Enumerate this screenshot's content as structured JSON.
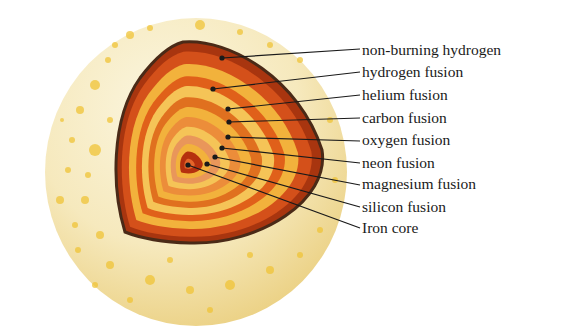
{
  "diagram": {
    "colors": {
      "sphere_light": "#faf3d6",
      "sphere_dark": "#edd48a",
      "speckle": "#f0c437",
      "outline": "#4a2a17",
      "layer_dark_red": "#a8350f",
      "layer_orange": "#e0601a",
      "layer_light_orange": "#ec8d3a",
      "layer_yellow": "#f2b23c",
      "layer_pale": "#f5c457",
      "layer_salmon": "#e9965a",
      "core": "#b5300e",
      "core_inner": "#e4652a"
    },
    "labels": [
      {
        "text": "non-burning hydrogen",
        "y": 41,
        "dot": [
          222,
          58
        ],
        "end": [
          360,
          49
        ]
      },
      {
        "text": "hydrogen fusion",
        "y": 63,
        "dot": [
          213,
          89
        ],
        "end": [
          360,
          72
        ]
      },
      {
        "text": "helium fusion",
        "y": 86,
        "dot": [
          228,
          109
        ],
        "end": [
          360,
          95
        ]
      },
      {
        "text": "carbon fusion",
        "y": 109,
        "dot": [
          229,
          122
        ],
        "end": [
          360,
          118
        ]
      },
      {
        "text": "oxygen fusion",
        "y": 131,
        "dot": [
          228,
          137
        ],
        "end": [
          360,
          141
        ]
      },
      {
        "text": "neon fusion",
        "y": 154,
        "dot": [
          222,
          148
        ],
        "end": [
          360,
          163
        ]
      },
      {
        "text": "magnesium fusion",
        "y": 175,
        "dot": [
          215,
          157
        ],
        "end": [
          360,
          185
        ]
      },
      {
        "text": "silicon fusion",
        "y": 198,
        "dot": [
          207,
          164
        ],
        "end": [
          360,
          207
        ]
      },
      {
        "text": "Iron core",
        "y": 219,
        "dot": [
          188,
          165
        ],
        "end": [
          360,
          228
        ]
      }
    ]
  }
}
